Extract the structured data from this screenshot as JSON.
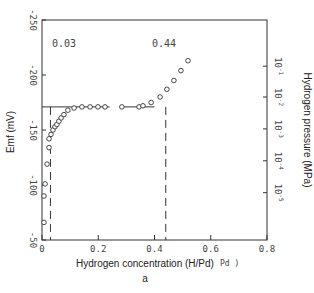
{
  "chart_data": {
    "type": "scatter",
    "panel_label": "a",
    "xlabel": "Hydrogen concentration (H/Pd)",
    "xlabel_residue": "Pd )",
    "ylabel_left": "Emf (mV)",
    "ylabel_right": "Hydrogen pressure (MPa)",
    "xlim": [
      0,
      0.8
    ],
    "ylim": [
      -50,
      -250
    ],
    "x_ticks": [
      {
        "value": 0,
        "label": "0"
      },
      {
        "value": 0.2,
        "label": "0.2"
      },
      {
        "value": 0.4,
        "label": "0.4"
      },
      {
        "value": 0.6,
        "label": "0.6"
      },
      {
        "value": 0.8,
        "label": "0.8"
      }
    ],
    "y_ticks_left": [
      {
        "value": -250,
        "label": "-250"
      },
      {
        "value": -200,
        "label": "-200"
      },
      {
        "value": -150,
        "label": "-150"
      },
      {
        "value": -100,
        "label": "-100"
      },
      {
        "value": -50,
        "label": "-50"
      }
    ],
    "y_ticks_right": [
      {
        "emf": -208,
        "base": "10",
        "exp": "-1"
      },
      {
        "emf": -180,
        "base": "10",
        "exp": "-2"
      },
      {
        "emf": -151,
        "base": "10",
        "exp": "-3"
      },
      {
        "emf": -122,
        "base": "10",
        "exp": "-4"
      },
      {
        "emf": -93,
        "base": "10",
        "exp": "-5"
      }
    ],
    "annotations": [
      {
        "text": "0.03",
        "x": 0.03,
        "y": -235
      },
      {
        "text": "0.44",
        "x": 0.44,
        "y": -235
      }
    ],
    "plateau_emf": -171,
    "plateau_segments": [
      [
        0,
        0.24
      ],
      [
        0.28,
        0.4
      ]
    ],
    "dashed_verticals": [
      0.03,
      0.44
    ],
    "series": [
      {
        "name": "data",
        "marker": "circle-open",
        "points": [
          [
            0.007,
            -66
          ],
          [
            0.007,
            -90
          ],
          [
            0.011,
            -101
          ],
          [
            0.018,
            -119
          ],
          [
            0.025,
            -134
          ],
          [
            0.025,
            -142
          ],
          [
            0.032,
            -146
          ],
          [
            0.039,
            -150
          ],
          [
            0.046,
            -153
          ],
          [
            0.053,
            -155
          ],
          [
            0.06,
            -158
          ],
          [
            0.068,
            -161
          ],
          [
            0.078,
            -164
          ],
          [
            0.092,
            -168
          ],
          [
            0.114,
            -170
          ],
          [
            0.142,
            -171
          ],
          [
            0.171,
            -171
          ],
          [
            0.199,
            -171
          ],
          [
            0.224,
            -171
          ],
          [
            0.284,
            -171
          ],
          [
            0.345,
            -171
          ],
          [
            0.359,
            -172
          ],
          [
            0.388,
            -175
          ],
          [
            0.42,
            -180
          ],
          [
            0.444,
            -187
          ],
          [
            0.469,
            -195
          ],
          [
            0.494,
            -204
          ],
          [
            0.519,
            -213
          ]
        ]
      }
    ],
    "grid": false
  }
}
